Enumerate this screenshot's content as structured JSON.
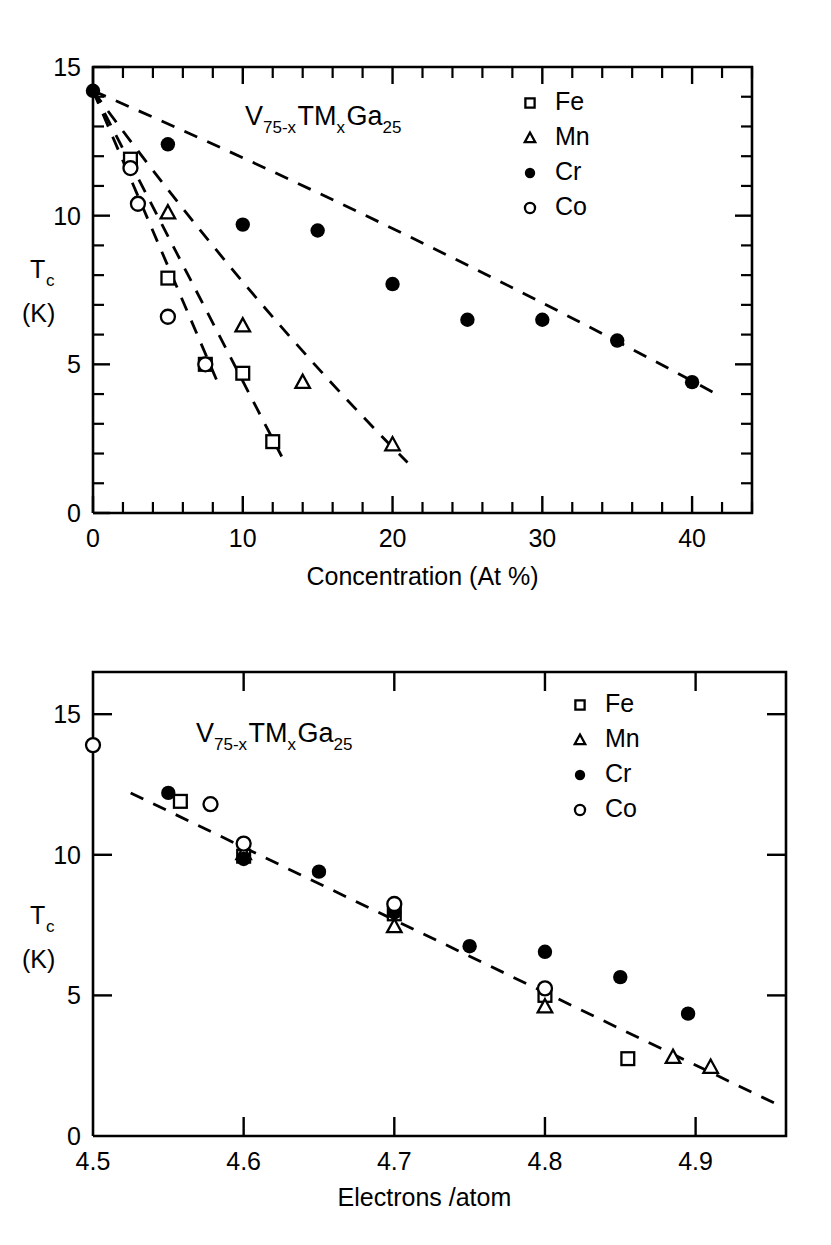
{
  "figure": {
    "panels": [
      "top",
      "bottom"
    ]
  },
  "chart_data": [
    {
      "id": "top",
      "type": "scatter",
      "title": "V75-xTMxGa25",
      "title_parts": {
        "v": "V",
        "v_sub": "75-x",
        "tm": "TM",
        "tm_sub": "x",
        "ga": "Ga",
        "ga_sub": "25"
      },
      "xlabel": "Concentration  (At %)",
      "ylabel": "Tc",
      "ylabel_sub": "c",
      "ylabel_units": "(K)",
      "xlim": [
        0,
        44
      ],
      "ylim": [
        0,
        15
      ],
      "xticks": [
        0,
        10,
        20,
        30,
        40
      ],
      "xticklabels": [
        "0",
        "10",
        "20",
        "30",
        "40"
      ],
      "xtick_minor_step": 2,
      "yticks": [
        0,
        5,
        10,
        15
      ],
      "yticklabels": [
        "0",
        "5",
        "10",
        "15"
      ],
      "ytick_minor_step": 1,
      "grid": false,
      "legend_position": "top-right",
      "series": [
        {
          "name": "Fe",
          "marker": "open-square",
          "points": [
            [
              0,
              14.2
            ],
            [
              2.5,
              11.9
            ],
            [
              5.0,
              7.9
            ],
            [
              7.5,
              5.0
            ],
            [
              10.0,
              4.7
            ],
            [
              12.0,
              2.4
            ]
          ],
          "trend": [
            [
              0,
              14.2
            ],
            [
              12.6,
              1.9
            ]
          ]
        },
        {
          "name": "Mn",
          "marker": "open-triangle",
          "points": [
            [
              0,
              14.2
            ],
            [
              5.0,
              10.1
            ],
            [
              10.0,
              6.3
            ],
            [
              14.0,
              4.4
            ],
            [
              20.0,
              2.3
            ]
          ],
          "trend": [
            [
              0,
              14.2
            ],
            [
              21.0,
              1.7
            ]
          ]
        },
        {
          "name": "Cr",
          "marker": "filled-circle",
          "points": [
            [
              0,
              14.2
            ],
            [
              5.0,
              12.4
            ],
            [
              10.0,
              9.7
            ],
            [
              15.0,
              9.5
            ],
            [
              20.0,
              7.7
            ],
            [
              25.0,
              6.5
            ],
            [
              30.0,
              6.5
            ],
            [
              35.0,
              5.8
            ],
            [
              40.0,
              4.4
            ]
          ],
          "trend": [
            [
              0,
              14.2
            ],
            [
              42.0,
              3.9
            ]
          ]
        },
        {
          "name": "Co",
          "marker": "open-circle",
          "points": [
            [
              0,
              14.2
            ],
            [
              2.5,
              11.6
            ],
            [
              3.0,
              10.4
            ],
            [
              5.0,
              6.6
            ],
            [
              7.5,
              5.0
            ]
          ],
          "trend": [
            [
              0,
              14.2
            ],
            [
              8.4,
              4.3
            ]
          ]
        }
      ]
    },
    {
      "id": "bottom",
      "type": "scatter",
      "title": "V75-xTMxGa25",
      "title_parts": {
        "v": "V",
        "v_sub": "75-x",
        "tm": "TM",
        "tm_sub": "x",
        "ga": "Ga",
        "ga_sub": "25"
      },
      "xlabel": "Electrons /atom",
      "ylabel": "Tc",
      "ylabel_sub": "c",
      "ylabel_units": "(K)",
      "xlim": [
        4.5,
        4.96
      ],
      "ylim": [
        0,
        16.5
      ],
      "xticks": [
        4.5,
        4.6,
        4.7,
        4.8,
        4.9
      ],
      "xticklabels": [
        "4.5",
        "4.6",
        "4.7",
        "4.8",
        "4.9"
      ],
      "yticks": [
        0,
        5,
        10,
        15
      ],
      "yticklabels": [
        "0",
        "5",
        "10",
        "15"
      ],
      "grid": false,
      "legend_position": "top-right",
      "trendline": [
        [
          4.525,
          12.2
        ],
        [
          4.955,
          1.1
        ]
      ],
      "series": [
        {
          "name": "Fe",
          "marker": "open-square",
          "points": [
            [
              4.558,
              11.9
            ],
            [
              4.6,
              9.95
            ],
            [
              4.7,
              7.9
            ],
            [
              4.8,
              5.0
            ],
            [
              4.855,
              2.75
            ]
          ]
        },
        {
          "name": "Mn",
          "marker": "open-triangle",
          "points": [
            [
              4.6,
              10.05
            ],
            [
              4.7,
              7.45
            ],
            [
              4.8,
              4.6
            ],
            [
              4.885,
              2.8
            ],
            [
              4.91,
              2.45
            ]
          ]
        },
        {
          "name": "Cr",
          "marker": "filled-circle",
          "points": [
            [
              4.55,
              12.2
            ],
            [
              4.6,
              9.85
            ],
            [
              4.65,
              9.4
            ],
            [
              4.7,
              7.95
            ],
            [
              4.75,
              6.75
            ],
            [
              4.8,
              6.55
            ],
            [
              4.85,
              5.65
            ],
            [
              4.895,
              4.35
            ]
          ]
        },
        {
          "name": "Co",
          "marker": "open-circle",
          "points": [
            [
              4.5,
              13.9
            ],
            [
              4.578,
              11.8
            ],
            [
              4.6,
              10.4
            ],
            [
              4.7,
              8.25
            ],
            [
              4.8,
              5.25
            ]
          ]
        }
      ]
    }
  ],
  "legend": {
    "items": [
      {
        "label": "Fe",
        "marker": "open-square"
      },
      {
        "label": "Mn",
        "marker": "open-triangle"
      },
      {
        "label": "Cr",
        "marker": "filled-circle"
      },
      {
        "label": "Co",
        "marker": "open-circle"
      }
    ]
  }
}
